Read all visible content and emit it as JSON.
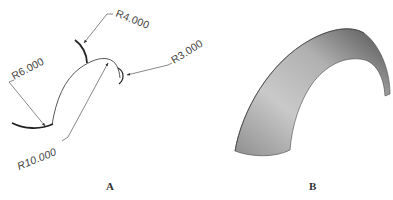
{
  "figure": {
    "panels": [
      {
        "id": "A",
        "label": "A",
        "kind": "wireframe-profile",
        "dimensions": [
          {
            "name": "R4.000",
            "text": "R4.000",
            "value": 4.0
          },
          {
            "name": "R3.000",
            "text": "R3.000",
            "value": 3.0
          },
          {
            "name": "R6.000",
            "text": "R6.000",
            "value": 6.0
          },
          {
            "name": "R10.000",
            "text": "R10.000",
            "value": 10.0
          }
        ]
      },
      {
        "id": "B",
        "label": "B",
        "kind": "shaded-swept-solid"
      }
    ],
    "colors": {
      "line": "#444444",
      "thick_line": "#222222",
      "shade_light": "#c8c8c8",
      "shade_mid": "#9a9a9a",
      "shade_dark": "#5e5e5e",
      "text": "#444444"
    }
  }
}
